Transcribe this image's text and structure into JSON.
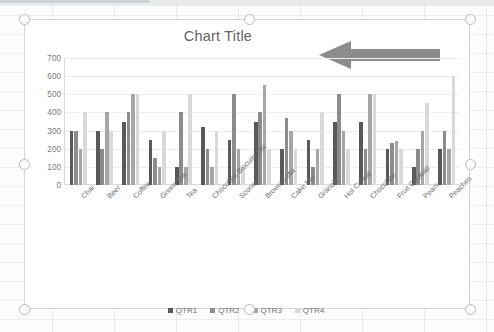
{
  "chart_object": {
    "selected": true,
    "handle_names": [
      "top-left",
      "top-center",
      "top-right",
      "middle-left",
      "middle-right",
      "bottom-left",
      "bottom-center",
      "bottom-right"
    ]
  },
  "annotation": {
    "shape": "left-arrow",
    "color": "#8c8c8c"
  },
  "chart_data": {
    "type": "bar",
    "title": "Chart Title",
    "xlabel": "",
    "ylabel": "",
    "ylim": [
      0,
      700
    ],
    "yticks": [
      700,
      600,
      500,
      400,
      300,
      200,
      100,
      0
    ],
    "grid": true,
    "legend_position": "bottom",
    "categories": [
      "Chai",
      "Beer",
      "Coffee",
      "Green Tea",
      "Tea",
      "Chocolate Biscuits Mix",
      "Scones",
      "Brownie Mix",
      "Cake Mix",
      "Granola",
      "Hot Cereal",
      "Chocolate",
      "Fruit Cocktail",
      "Pears",
      "Peaches"
    ],
    "series": [
      {
        "name": "QTR1",
        "color": "#595959",
        "values": [
          300,
          300,
          350,
          250,
          100,
          320,
          250,
          350,
          200,
          250,
          350,
          350,
          200,
          100,
          200
        ]
      },
      {
        "name": "QTR2",
        "color": "#8c8c8c",
        "values": [
          300,
          200,
          400,
          150,
          400,
          200,
          500,
          400,
          370,
          100,
          500,
          200,
          230,
          200,
          300
        ]
      },
      {
        "name": "QTR3",
        "color": "#a6a6a6",
        "values": [
          200,
          400,
          500,
          100,
          100,
          100,
          200,
          550,
          300,
          200,
          300,
          500,
          240,
          300,
          200
        ]
      },
      {
        "name": "QTR4",
        "color": "#d9d9d9",
        "values": [
          400,
          300,
          500,
          300,
          500,
          300,
          100,
          200,
          200,
          400,
          200,
          500,
          200,
          450,
          600
        ]
      }
    ]
  }
}
